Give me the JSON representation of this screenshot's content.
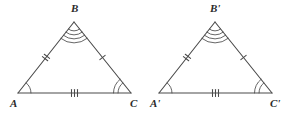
{
  "diagram": {
    "stroke_color": "#4a4a4a",
    "label_color": "#2b2b2b",
    "background_color": "#ffffff",
    "triangles": [
      {
        "id": "triangle-abc",
        "name": "Triangle ABC",
        "vertices": [
          {
            "key": "A",
            "label": "A",
            "x": 18,
            "y": 93,
            "label_x": 10,
            "label_y": 107,
            "angle_arcs": 1
          },
          {
            "key": "B",
            "label": "B",
            "x": 74,
            "y": 22,
            "label_x": 71,
            "label_y": 12,
            "angle_arcs": 4
          },
          {
            "key": "C",
            "label": "C",
            "x": 131,
            "y": 93,
            "label_x": 130,
            "label_y": 107,
            "angle_arcs": 2
          }
        ],
        "sides": [
          {
            "key": "AB",
            "label": "AB",
            "from": "A",
            "to": "B",
            "ticks": 2
          },
          {
            "key": "BC",
            "label": "BC",
            "from": "B",
            "to": "C",
            "ticks": 1
          },
          {
            "key": "AC",
            "label": "AC",
            "from": "A",
            "to": "C",
            "ticks": 3
          }
        ]
      },
      {
        "id": "triangle-a-prime-b-prime-c-prime",
        "name": "Triangle A prime B prime C prime",
        "vertices": [
          {
            "key": "A'",
            "label": "A'",
            "x": 159,
            "y": 93,
            "label_x": 150,
            "label_y": 107,
            "angle_arcs": 1
          },
          {
            "key": "B'",
            "label": "B'",
            "x": 215,
            "y": 22,
            "label_x": 210,
            "label_y": 12,
            "angle_arcs": 4
          },
          {
            "key": "C'",
            "label": "C'",
            "x": 272,
            "y": 93,
            "label_x": 270,
            "label_y": 107,
            "angle_arcs": 2
          }
        ],
        "sides": [
          {
            "key": "A'B'",
            "label": "A'B'",
            "from": "A'",
            "to": "B'",
            "ticks": 2
          },
          {
            "key": "B'C'",
            "label": "B'C'",
            "from": "B'",
            "to": "C'",
            "ticks": 1
          },
          {
            "key": "A'C'",
            "label": "A'C'",
            "from": "A'",
            "to": "C'",
            "ticks": 3
          }
        ]
      }
    ]
  }
}
